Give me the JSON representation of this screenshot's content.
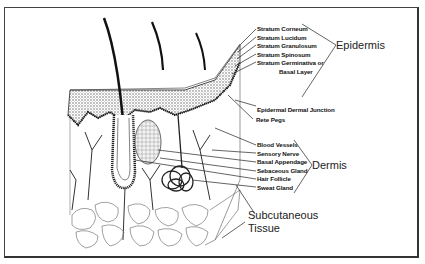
{
  "diagram": {
    "groups": {
      "epidermis": {
        "label": "Epidermis",
        "layers": [
          "Stratum Corneum",
          "Stratum Lucidum",
          "Stratum Granulosum",
          "Stratum Spinosum",
          "Stratum Germinativa or",
          "Basal Layer"
        ]
      },
      "junction": [
        "Epidermal Dermal Junction",
        "Rete Pegs"
      ],
      "dermis": {
        "label": "Dermis",
        "structures": [
          "Blood Vessels",
          "Sensory Nerve",
          "Basal Appendage",
          "Sebaceous Gland",
          "Hair Follicle",
          "Sweat Gland"
        ]
      },
      "subcutaneous": {
        "label_line1": "Subcutaneous",
        "label_line2": "Tissue"
      }
    },
    "colors": {
      "line": "#222222",
      "stipple": "#555555",
      "border": "#444444"
    }
  }
}
